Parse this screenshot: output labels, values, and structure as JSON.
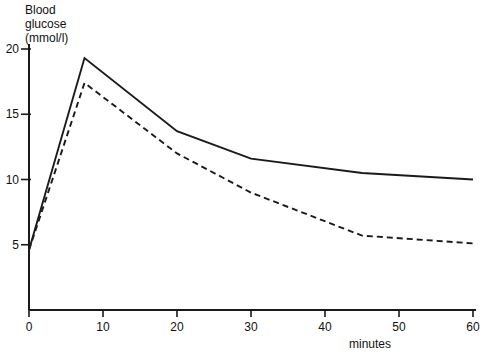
{
  "chart_data": {
    "type": "line",
    "title": "",
    "ylabel_lines": [
      "Blood",
      "glucose",
      "(mmol/l)"
    ],
    "xlabel": "minutes",
    "x_ticks": [
      0,
      10,
      20,
      30,
      40,
      50,
      60
    ],
    "y_ticks": [
      5,
      10,
      15,
      20
    ],
    "xlim": [
      0,
      60
    ],
    "ylim": [
      0,
      20
    ],
    "grid": false,
    "legend": "none",
    "line_color": "#1a1a1a",
    "background": "#ffffff",
    "series": [
      {
        "name": "solid-line",
        "style": "solid",
        "points": [
          [
            0,
            4.6
          ],
          [
            7.5,
            19.3
          ],
          [
            20,
            13.7
          ],
          [
            30,
            11.6
          ],
          [
            45,
            10.5
          ],
          [
            60,
            10.0
          ]
        ]
      },
      {
        "name": "dashed-line",
        "style": "dashed",
        "points": [
          [
            0,
            4.6
          ],
          [
            7.5,
            17.4
          ],
          [
            20,
            12.0
          ],
          [
            30,
            9.0
          ],
          [
            45,
            5.7
          ],
          [
            60,
            5.1
          ]
        ]
      }
    ]
  }
}
